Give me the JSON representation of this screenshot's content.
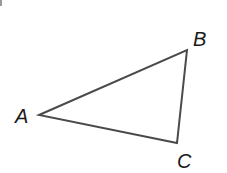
{
  "diagram": {
    "type": "triangle",
    "stroke_color": "#4a4a4a",
    "vertices": [
      {
        "label": "A",
        "x": 39,
        "y": 115,
        "label_x": 15,
        "label_y": 123
      },
      {
        "label": "B",
        "x": 187,
        "y": 50,
        "label_x": 193,
        "label_y": 46
      },
      {
        "label": "C",
        "x": 177,
        "y": 143,
        "label_x": 177,
        "label_y": 168
      }
    ]
  }
}
